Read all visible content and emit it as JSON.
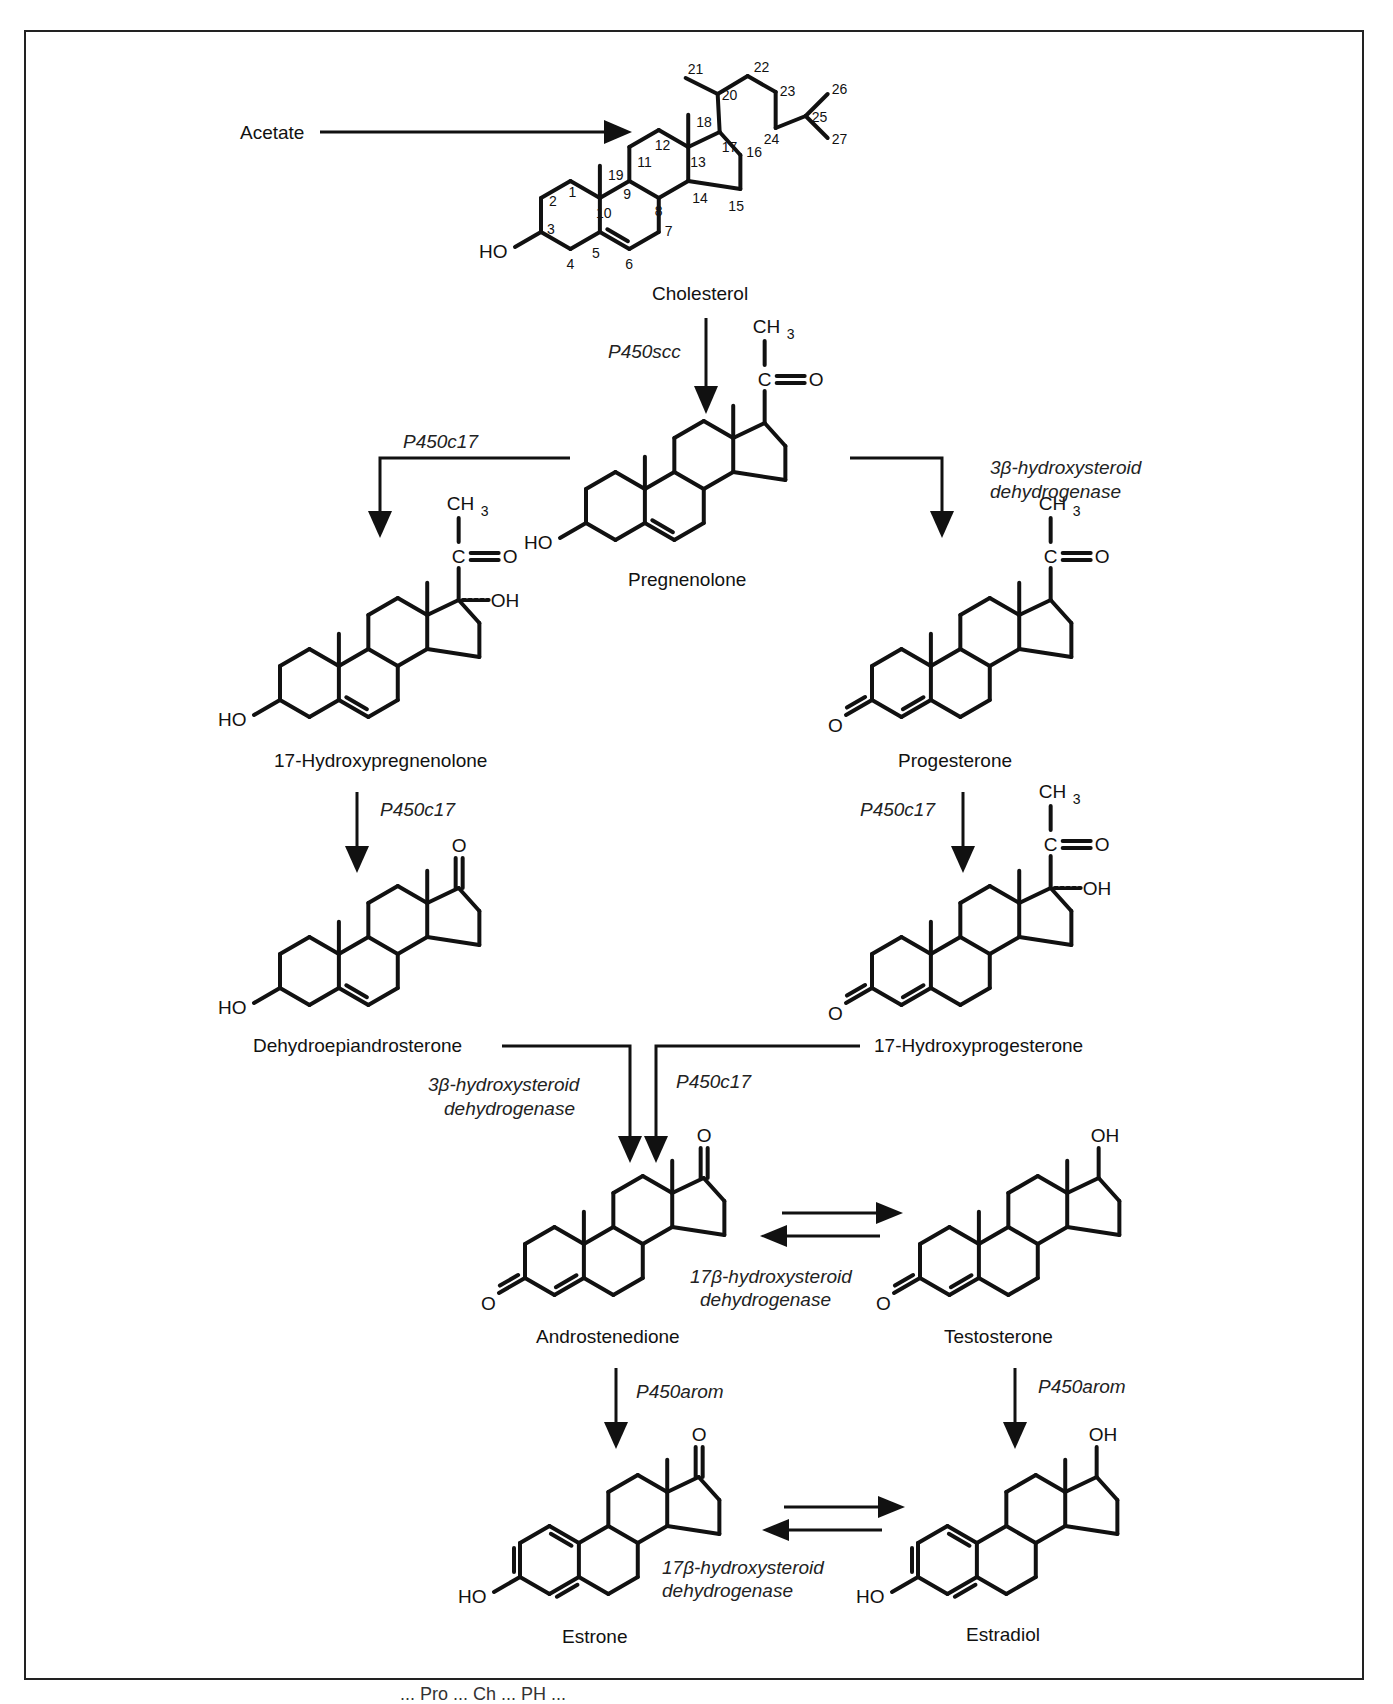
{
  "figure": {
    "frame": {
      "border_color": "#222222"
    },
    "footer_partial": "... Pro ... Ch ... PH ..."
  },
  "compounds": {
    "acetate": "Acetate",
    "cholesterol": "Cholesterol",
    "pregnenolone": "Pregnenolone",
    "hydroxypregnenolone": "17-Hydroxypregnenolone",
    "progesterone": "Progesterone",
    "dhea": "Dehydroepiandrosterone",
    "hydroxyprogesterone": "17-Hydroxyprogesterone",
    "androstenedione": "Androstenedione",
    "testosterone": "Testosterone",
    "estrone": "Estrone",
    "estradiol": "Estradiol"
  },
  "enzymes": {
    "scc": "P450scc",
    "c17_left": "P450c17",
    "hsd3b_right_1": "3β-hydroxysteroid",
    "hsd3b_right_2": "dehydrogenase",
    "c17_left_2": "P450c17",
    "c17_right_2": "P450c17",
    "hsd3b_lower_1": "3β-hydroxysteroid",
    "hsd3b_lower_2": "dehydrogenase",
    "c17_lower": "P450c17",
    "hsd17b_upper_1": "17β-hydroxysteroid",
    "hsd17b_upper_2": "dehydrogenase",
    "arom_left": "P450arom",
    "arom_right": "P450arom",
    "hsd17b_lower_1": "17β-hydroxysteroid",
    "hsd17b_lower_2": "dehydrogenase"
  },
  "atoms": {
    "HO": "HO",
    "O": "O",
    "OH": "OH",
    "CH3": "CH",
    "sub3": "3",
    "C": "C"
  },
  "cholesterol_numbering": [
    "1",
    "2",
    "3",
    "4",
    "5",
    "6",
    "7",
    "8",
    "9",
    "10",
    "11",
    "12",
    "13",
    "14",
    "15",
    "16",
    "17",
    "18",
    "19",
    "20",
    "21",
    "22",
    "23",
    "24",
    "25",
    "26",
    "27"
  ],
  "pathway": [
    {
      "from": "Acetate",
      "to": "Cholesterol",
      "enzyme": ""
    },
    {
      "from": "Cholesterol",
      "to": "Pregnenolone",
      "enzyme": "P450scc"
    },
    {
      "from": "Pregnenolone",
      "to": "17-Hydroxypregnenolone",
      "enzyme": "P450c17"
    },
    {
      "from": "Pregnenolone",
      "to": "Progesterone",
      "enzyme": "3β-hydroxysteroid dehydrogenase"
    },
    {
      "from": "17-Hydroxypregnenolone",
      "to": "Dehydroepiandrosterone",
      "enzyme": "P450c17"
    },
    {
      "from": "Progesterone",
      "to": "17-Hydroxyprogesterone",
      "enzyme": "P450c17"
    },
    {
      "from": "Dehydroepiandrosterone",
      "to": "Androstenedione",
      "enzyme": "3β-hydroxysteroid dehydrogenase"
    },
    {
      "from": "17-Hydroxyprogesterone",
      "to": "Androstenedione",
      "enzyme": "P450c17"
    },
    {
      "from": "Androstenedione",
      "to": "Testosterone",
      "enzyme": "17β-hydroxysteroid dehydrogenase",
      "reversible": true
    },
    {
      "from": "Androstenedione",
      "to": "Estrone",
      "enzyme": "P450arom"
    },
    {
      "from": "Testosterone",
      "to": "Estradiol",
      "enzyme": "P450arom"
    },
    {
      "from": "Estrone",
      "to": "Estradiol",
      "enzyme": "17β-hydroxysteroid dehydrogenase",
      "reversible": true
    }
  ]
}
